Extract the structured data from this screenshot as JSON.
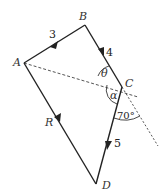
{
  "diagram": {
    "points": {
      "A": {
        "label": "A",
        "x": 24,
        "y": 63
      },
      "B": {
        "label": "B",
        "x": 85,
        "y": 25
      },
      "C": {
        "label": "C",
        "x": 122,
        "y": 87
      },
      "D": {
        "label": "D",
        "x": 96,
        "y": 184
      }
    },
    "vectors": [
      {
        "from": "A",
        "to": "B",
        "magnitude_label": "3"
      },
      {
        "from": "B",
        "to": "C",
        "magnitude_label": "4"
      },
      {
        "from": "C",
        "to": "D",
        "magnitude_label": "5"
      },
      {
        "from": "A",
        "to": "D",
        "magnitude_label": "R"
      }
    ],
    "angles": {
      "theta": "θ",
      "alpha": "α",
      "given": "70°"
    },
    "colors": {
      "line": "#222222",
      "dashed": "#555555",
      "label": "#333333"
    }
  }
}
